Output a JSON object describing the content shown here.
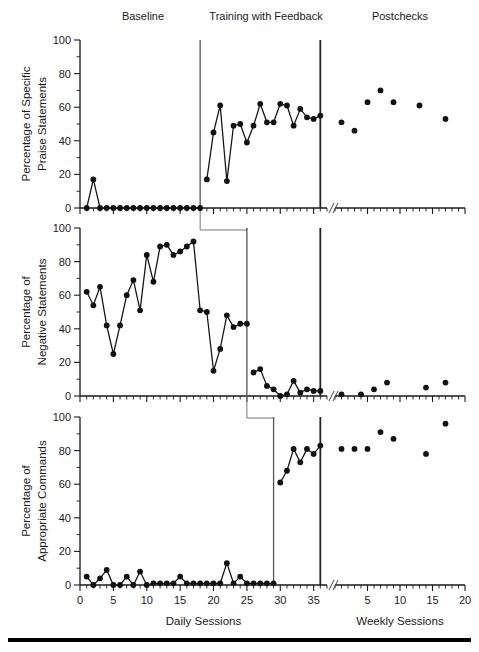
{
  "figure": {
    "phase_labels": [
      {
        "text": "Baseline",
        "x": 143
      },
      {
        "text": "Training with Feedback",
        "x": 266
      },
      {
        "text": "Postchecks",
        "x": 400
      }
    ],
    "x_axis": {
      "daily_title": "Daily Sessions",
      "weekly_title": "Weekly Sessions",
      "daily_ticks": [
        "0",
        "5",
        "10",
        "15",
        "20",
        "25",
        "30",
        "35"
      ],
      "weekly_ticks": [
        "5",
        "10",
        "15",
        "20"
      ],
      "break_marker": "//"
    },
    "y_ticks": [
      "0",
      "20",
      "40",
      "60",
      "80",
      "100"
    ],
    "colors": {
      "ink": "#111111",
      "axis": "#1a1a1a",
      "phase_line": "#555555",
      "phase_line_dark": "#222222"
    }
  },
  "chart_data": [
    {
      "type": "line",
      "panel": 1,
      "title": "Percentage of Specific Praise Statements",
      "ylabel_line1": "Percentage of Specific",
      "ylabel_line2": "Praise Statements",
      "xlabel": "Daily Sessions",
      "ylim": [
        0,
        100
      ],
      "xlim": [
        0,
        37
      ],
      "grid": false,
      "legend": "none",
      "phase_change_sessions": [
        18,
        36
      ],
      "series": [
        {
          "name": "Baseline",
          "connected": true,
          "x": [
            1,
            2,
            3,
            4,
            5,
            6,
            7,
            8,
            9,
            10,
            11,
            12,
            13,
            14,
            15,
            16,
            17,
            18
          ],
          "y": [
            0,
            17,
            0,
            0,
            0,
            0,
            0,
            0,
            0,
            0,
            0,
            0,
            0,
            0,
            0,
            0,
            0,
            0
          ]
        },
        {
          "name": "Training with Feedback",
          "connected": true,
          "x": [
            19,
            20,
            21,
            22,
            23,
            24,
            25,
            26,
            27,
            28,
            29,
            30,
            31,
            32,
            33,
            34,
            35,
            36
          ],
          "y": [
            17,
            45,
            61,
            16,
            49,
            50,
            39,
            49,
            62,
            51,
            51,
            62,
            61,
            49,
            59,
            54,
            53,
            55
          ]
        },
        {
          "name": "Postchecks",
          "connected": false,
          "x": [
            1,
            3,
            5,
            7,
            9,
            13,
            17
          ],
          "y": [
            51,
            46,
            63,
            70,
            63,
            61,
            53
          ]
        }
      ]
    },
    {
      "type": "line",
      "panel": 2,
      "title": "Percentage of Negative Statements",
      "ylabel_line1": "Percentage of",
      "ylabel_line2": "Negative Statements",
      "xlabel": "Daily Sessions",
      "ylim": [
        0,
        100
      ],
      "xlim": [
        0,
        37
      ],
      "grid": false,
      "legend": "none",
      "phase_change_sessions": [
        25,
        36
      ],
      "series": [
        {
          "name": "Baseline",
          "connected": true,
          "x": [
            1,
            2,
            3,
            4,
            5,
            6,
            7,
            8,
            9,
            10,
            11,
            12,
            13,
            14,
            15,
            16,
            17,
            18,
            19,
            20,
            21,
            22,
            23,
            24,
            25
          ],
          "y": [
            62,
            54,
            65,
            42,
            25,
            42,
            60,
            69,
            51,
            84,
            68,
            89,
            90,
            84,
            86,
            89,
            92,
            51,
            50,
            15,
            28,
            48,
            41,
            43,
            43
          ]
        },
        {
          "name": "Training with Feedback",
          "connected": true,
          "x": [
            26,
            27,
            28,
            29,
            30,
            31,
            32,
            33,
            34,
            35,
            36
          ],
          "y": [
            14,
            16,
            6,
            4,
            0,
            1,
            9,
            2,
            4,
            3,
            3
          ]
        },
        {
          "name": "Postchecks",
          "connected": false,
          "x": [
            1,
            4,
            6,
            8,
            14,
            17
          ],
          "y": [
            1,
            1,
            4,
            8,
            5,
            8
          ]
        }
      ]
    },
    {
      "type": "line",
      "panel": 3,
      "title": "Percentage of Appropriate Commands",
      "ylabel_line1": "Percentage of",
      "ylabel_line2": "Appropriate Commands",
      "xlabel": "Daily Sessions",
      "ylim": [
        0,
        100
      ],
      "xlim": [
        0,
        37
      ],
      "grid": false,
      "legend": "none",
      "phase_change_sessions": [
        29,
        36
      ],
      "series": [
        {
          "name": "Baseline",
          "connected": true,
          "x": [
            1,
            2,
            3,
            4,
            5,
            6,
            7,
            8,
            9,
            10,
            11,
            12,
            13,
            14,
            15,
            16,
            17,
            18,
            19,
            20,
            21,
            22,
            23,
            24,
            25,
            26,
            27,
            28,
            29
          ],
          "y": [
            5,
            0,
            4,
            9,
            0,
            0,
            5,
            0,
            8,
            0,
            1,
            1,
            1,
            1,
            5,
            1,
            1,
            1,
            1,
            1,
            1,
            13,
            1,
            5,
            1,
            1,
            1,
            1,
            1
          ]
        },
        {
          "name": "Training with Feedback",
          "connected": true,
          "x": [
            30,
            31,
            32,
            33,
            34,
            35,
            36
          ],
          "y": [
            61,
            68,
            81,
            73,
            81,
            78,
            83
          ]
        },
        {
          "name": "Postchecks",
          "connected": false,
          "x": [
            1,
            3,
            5,
            7,
            9,
            14,
            17
          ],
          "y": [
            81,
            81,
            81,
            91,
            87,
            78,
            96
          ]
        }
      ]
    }
  ]
}
